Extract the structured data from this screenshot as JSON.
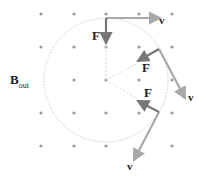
{
  "field_label": "B",
  "field_subscript": "out",
  "force_label": "F",
  "velocity_label": "v",
  "colors": {
    "dot": "#9a9a9a",
    "force": "#777777",
    "velocity": "#a8a8a8",
    "circle": "#bbbbbb"
  }
}
